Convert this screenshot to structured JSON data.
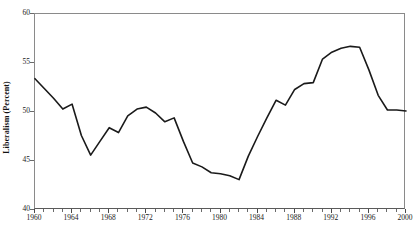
{
  "chart_data": {
    "type": "line",
    "title": "",
    "xlabel": "",
    "ylabel": "Liberalism (Percent)",
    "xlim": [
      1960,
      2000
    ],
    "ylim": [
      40,
      60
    ],
    "ytick_labels": [
      "60",
      "55",
      "50",
      "45",
      "40"
    ],
    "ytick_values": [
      60,
      55,
      50,
      45,
      40
    ],
    "xtick_labels": [
      "1960",
      "1964",
      "1968",
      "1972",
      "1976",
      "1980",
      "1984",
      "1988",
      "1992",
      "1996",
      "2000"
    ],
    "xtick_values": [
      1960,
      1964,
      1968,
      1972,
      1976,
      1980,
      1984,
      1988,
      1992,
      1996,
      2000
    ],
    "grid": false,
    "legend": false,
    "line_color": "#1a1a1a",
    "line_width": 1.6,
    "x": [
      1960,
      1961,
      1962,
      1963,
      1964,
      1965,
      1966,
      1967,
      1968,
      1969,
      1970,
      1971,
      1972,
      1973,
      1974,
      1975,
      1976,
      1977,
      1978,
      1979,
      1980,
      1981,
      1982,
      1983,
      1984,
      1985,
      1986,
      1987,
      1988,
      1989,
      1990,
      1991,
      1992,
      1993,
      1994,
      1995,
      1996,
      1997,
      1998,
      1999,
      2000
    ],
    "values": [
      53.4,
      52.4,
      51.4,
      50.3,
      50.8,
      47.6,
      45.6,
      47.0,
      48.4,
      47.9,
      49.6,
      50.3,
      50.5,
      49.9,
      49.0,
      49.4,
      47.0,
      44.8,
      44.4,
      43.8,
      43.7,
      43.5,
      43.1,
      45.5,
      47.5,
      49.4,
      51.2,
      50.7,
      52.3,
      52.9,
      53.0,
      55.4,
      56.1,
      56.5,
      56.7,
      56.6,
      54.3,
      51.7,
      50.2,
      50.2,
      50.1
    ],
    "series": [
      {
        "name": "Liberalism",
        "values": [
          53.4,
          52.4,
          51.4,
          50.3,
          50.8,
          47.6,
          45.6,
          47.0,
          48.4,
          47.9,
          49.6,
          50.3,
          50.5,
          49.9,
          49.0,
          49.4,
          47.0,
          44.8,
          44.4,
          43.8,
          43.7,
          43.5,
          43.1,
          45.5,
          47.5,
          49.4,
          51.2,
          50.7,
          52.3,
          52.9,
          53.0,
          55.4,
          56.1,
          56.5,
          56.7,
          56.6,
          54.3,
          51.7,
          50.2,
          50.2,
          50.1
        ]
      }
    ],
    "points": [
      {
        "x": 1960,
        "y": 53.4
      },
      {
        "x": 1961,
        "y": 52.4
      },
      {
        "x": 1962,
        "y": 51.4
      },
      {
        "x": 1963,
        "y": 50.3
      },
      {
        "x": 1964,
        "y": 50.8
      },
      {
        "x": 1965,
        "y": 47.6
      },
      {
        "x": 1966,
        "y": 45.6
      },
      {
        "x": 1967,
        "y": 47.0
      },
      {
        "x": 1968,
        "y": 48.4
      },
      {
        "x": 1969,
        "y": 47.9
      },
      {
        "x": 1970,
        "y": 49.6
      },
      {
        "x": 1971,
        "y": 50.3
      },
      {
        "x": 1972,
        "y": 50.5
      },
      {
        "x": 1973,
        "y": 49.9
      },
      {
        "x": 1974,
        "y": 49.0
      },
      {
        "x": 1975,
        "y": 49.4
      },
      {
        "x": 1976,
        "y": 47.0
      },
      {
        "x": 1977,
        "y": 44.8
      },
      {
        "x": 1978,
        "y": 44.4
      },
      {
        "x": 1979,
        "y": 43.8
      },
      {
        "x": 1980,
        "y": 43.7
      },
      {
        "x": 1981,
        "y": 43.5
      },
      {
        "x": 1982,
        "y": 43.1
      },
      {
        "x": 1983,
        "y": 45.5
      },
      {
        "x": 1984,
        "y": 47.5
      },
      {
        "x": 1985,
        "y": 49.4
      },
      {
        "x": 1986,
        "y": 51.2
      },
      {
        "x": 1987,
        "y": 50.7
      },
      {
        "x": 1988,
        "y": 52.3
      },
      {
        "x": 1989,
        "y": 52.9
      },
      {
        "x": 1990,
        "y": 53.0
      },
      {
        "x": 1991,
        "y": 55.4
      },
      {
        "x": 1992,
        "y": 56.1
      },
      {
        "x": 1993,
        "y": 56.5
      },
      {
        "x": 1994,
        "y": 56.7
      },
      {
        "x": 1995,
        "y": 56.6
      },
      {
        "x": 1996,
        "y": 54.3
      },
      {
        "x": 1997,
        "y": 51.7
      },
      {
        "x": 1998,
        "y": 50.2
      },
      {
        "x": 1999,
        "y": 50.2
      },
      {
        "x": 2000,
        "y": 50.1
      }
    ]
  }
}
